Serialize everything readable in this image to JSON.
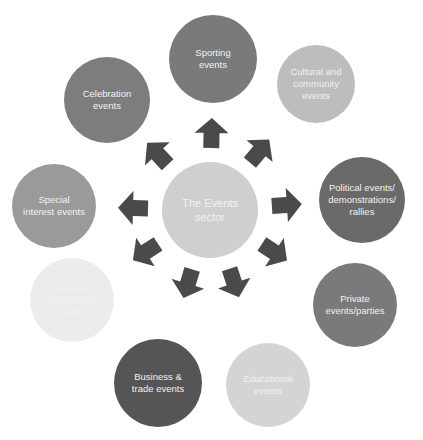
{
  "diagram": {
    "title": "The Events sector",
    "center": {
      "label": "The Events\nsector",
      "color": "#cfcfcf",
      "x": 210,
      "y": 210,
      "r": 48
    },
    "arrow_color": "#4a4a4a",
    "nodes": [
      {
        "id": "sporting",
        "label": "Sporting\nevents",
        "color": "#7a7a7a",
        "x": 213,
        "y": 59,
        "r": 44
      },
      {
        "id": "cultural",
        "label": "Cultural and\ncommunity\nevents",
        "color": "#bdbdbd",
        "x": 316,
        "y": 84,
        "r": 39
      },
      {
        "id": "political",
        "label": "Political events/\ndemonstrations/\nrallies",
        "color": "#6a6a6a",
        "x": 362,
        "y": 200,
        "r": 43
      },
      {
        "id": "private",
        "label": "Private\nevents/parties",
        "color": "#7a7a7a",
        "x": 355,
        "y": 305,
        "r": 42
      },
      {
        "id": "educational",
        "label": "Educational\nevents",
        "color": "#d4d4d4",
        "x": 268,
        "y": 385,
        "r": 42
      },
      {
        "id": "business",
        "label": "Business &\ntrade events",
        "color": "#555555",
        "x": 158,
        "y": 383,
        "r": 44
      },
      {
        "id": "leisure",
        "label": "Leisure/\nrecreational\nevents",
        "color": "#ececec",
        "x": 72,
        "y": 300,
        "r": 42
      },
      {
        "id": "special",
        "label": "Special\ninterest events",
        "color": "#9a9a9a",
        "x": 54,
        "y": 206,
        "r": 42
      },
      {
        "id": "celebration",
        "label": "Celebration\nevents",
        "color": "#7d7d7d",
        "x": 107,
        "y": 100,
        "r": 43
      }
    ]
  }
}
